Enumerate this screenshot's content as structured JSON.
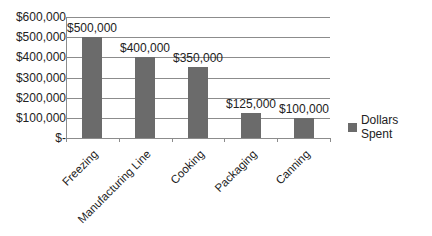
{
  "chart_data": {
    "type": "bar",
    "title": "",
    "xlabel": "",
    "ylabel": "",
    "categories": [
      "Freezing",
      "Manufacturing Line",
      "Cooking",
      "Packaging",
      "Canning"
    ],
    "series": [
      {
        "name": "Dollars Spent",
        "values": [
          500000,
          400000,
          350000,
          125000,
          100000
        ],
        "color": "#6b6b6b"
      }
    ],
    "data_labels": [
      "$500,000",
      "$400,000",
      "$350,000",
      "$125,000",
      "$100,000"
    ],
    "ylim": [
      0,
      600000
    ],
    "yticks": [
      0,
      100000,
      200000,
      300000,
      400000,
      500000,
      600000
    ],
    "ytick_labels": [
      "$-",
      "$100,000",
      "$200,000",
      "$300,000",
      "$400,000",
      "$500,000",
      "$600,000"
    ],
    "grid": true,
    "legend_position": "right"
  },
  "legend": {
    "label": "Dollars Spent"
  }
}
